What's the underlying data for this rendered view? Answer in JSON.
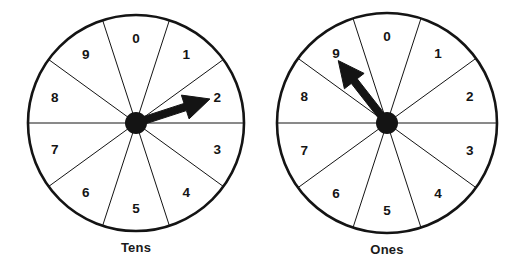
{
  "page": {
    "background_color": "#ffffff",
    "ink_color": "#141414",
    "width": 523,
    "height": 268
  },
  "spinners": [
    {
      "id": "tens",
      "caption": "Tens",
      "caption_name": "tens-wheel-caption",
      "center_x": 136,
      "center_y": 123,
      "radius": 108,
      "sector_count": 10,
      "sector_degrees": 36,
      "numbers": [
        "0",
        "1",
        "2",
        "3",
        "4",
        "5",
        "6",
        "7",
        "8",
        "9"
      ],
      "pointer": {
        "angle_degrees": 18,
        "direction": "right-up",
        "points_at": "2",
        "length_ratio": 0.72
      }
    },
    {
      "id": "ones",
      "caption": "Ones",
      "caption_name": "ones-wheel-caption",
      "center_x": 387,
      "center_y": 123,
      "radius": 110,
      "sector_count": 10,
      "sector_degrees": 36,
      "numbers": [
        "0",
        "1",
        "2",
        "3",
        "4",
        "5",
        "6",
        "7",
        "8",
        "9"
      ],
      "pointer": {
        "angle_degrees": 128,
        "direction": "up-left",
        "points_at": "9",
        "length_ratio": 0.72
      }
    }
  ],
  "style": {
    "rim_stroke_width": 2.6,
    "spoke_stroke_width": 1.0,
    "hub_radius": 11,
    "label_radius_ratio": 0.79
  }
}
